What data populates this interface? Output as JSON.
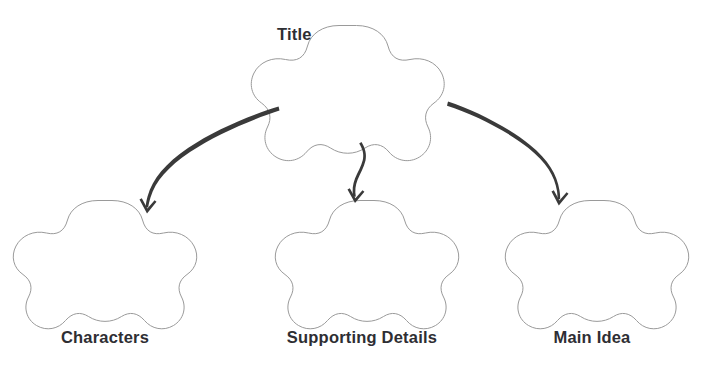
{
  "canvas": {
    "width": 701,
    "height": 366,
    "background": "#ffffff"
  },
  "style": {
    "shape_outline_color": "#9a9a9a",
    "shape_fill_color": "#ffffff",
    "arrow_color": "#3a3a3a",
    "label_color": "#2e2e33"
  },
  "diagram": {
    "type": "graphic-organizer",
    "shape_kind": "five-lobed-flower-blob",
    "root": {
      "label": "Title"
    },
    "branches": [
      {
        "label": "Characters"
      },
      {
        "label": "Supporting Details"
      },
      {
        "label": "Main Idea"
      }
    ],
    "connectors": [
      {
        "name": "arrow-title-to-characters",
        "direction": "down-left"
      },
      {
        "name": "arrow-title-to-supporting-details",
        "direction": "down"
      },
      {
        "name": "arrow-title-to-main-idea",
        "direction": "down-right"
      }
    ]
  }
}
